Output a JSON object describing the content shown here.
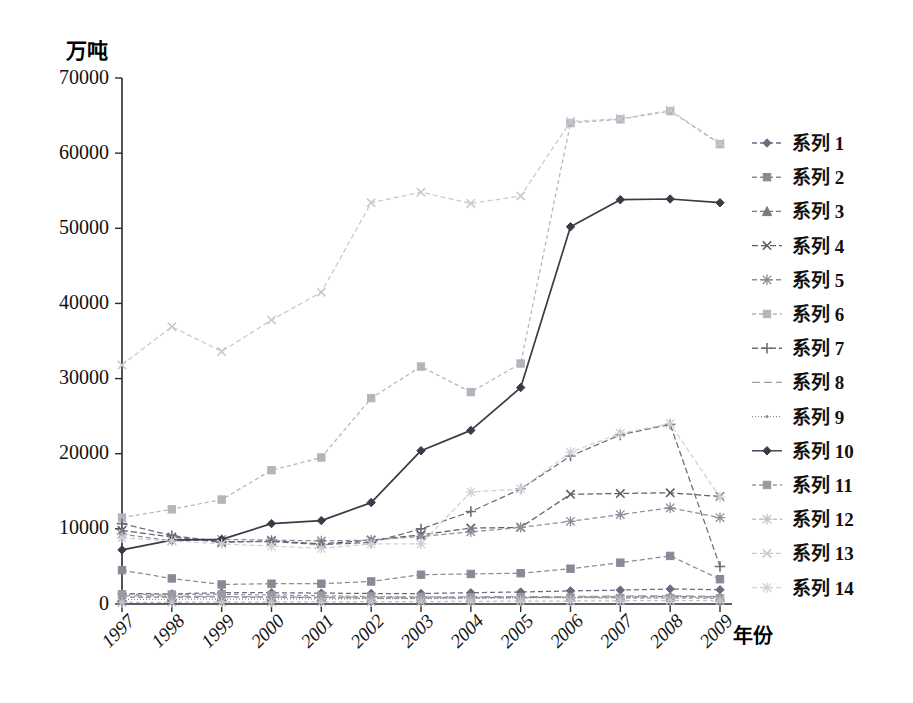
{
  "chart_data": {
    "type": "line",
    "title": "",
    "ylabel": "万吨",
    "xlabel": "年份",
    "ylim": [
      0,
      70000
    ],
    "ytick_values": [
      0,
      10000,
      20000,
      30000,
      40000,
      50000,
      60000,
      70000
    ],
    "ytick_labels": [
      "0",
      "10000",
      "20000",
      "30000",
      "40000",
      "50000",
      "60000",
      "70000"
    ],
    "grid": false,
    "legend_position": "right",
    "categories": [
      "1997",
      "1998",
      "1999",
      "2000",
      "2001",
      "2002",
      "2003",
      "2004",
      "2005",
      "2006",
      "2007",
      "2008",
      "2009"
    ],
    "series": [
      {
        "name": "系列 1",
        "marker": "diamond",
        "color": "#6b6b80",
        "dash": "5,3",
        "values": [
          1400,
          1350,
          1500,
          1500,
          1450,
          1400,
          1400,
          1500,
          1600,
          1750,
          1850,
          2000,
          1900
        ]
      },
      {
        "name": "系列 2",
        "marker": "square",
        "color": "#8a8a96",
        "dash": "5,3",
        "values": [
          4500,
          3400,
          2600,
          2700,
          2700,
          3000,
          3900,
          4000,
          4100,
          4700,
          5500,
          6400,
          3300
        ]
      },
      {
        "name": "系列 3",
        "marker": "triangle",
        "color": "#7a7a86",
        "dash": "5,3",
        "values": [
          900,
          900,
          950,
          900,
          850,
          800,
          800,
          820,
          850,
          900,
          950,
          1000,
          950
        ]
      },
      {
        "name": "系列 4",
        "marker": "cross",
        "color": "#5d5d6b",
        "dash": "6,3",
        "values": [
          9800,
          8900,
          8200,
          8400,
          8000,
          8500,
          9200,
          10100,
          10200,
          14600,
          14700,
          14800,
          14300
        ]
      },
      {
        "name": "系列 5",
        "marker": "star",
        "color": "#8e8e9a",
        "dash": "5,3",
        "values": [
          9300,
          8400,
          8600,
          8500,
          8400,
          8500,
          9000,
          9600,
          10200,
          11000,
          11900,
          12800,
          11500
        ]
      },
      {
        "name": "系列 6",
        "marker": "square",
        "color": "#b4b4bd",
        "dash": "4,3",
        "values": [
          11500,
          12600,
          13900,
          17800,
          19500,
          27400,
          31600,
          28200,
          32000,
          64000,
          64500,
          65600,
          61200
        ]
      },
      {
        "name": "系列 7",
        "marker": "plus",
        "color": "#6d6d7a",
        "dash": "6,3",
        "values": [
          10700,
          9100,
          8300,
          8300,
          7900,
          8200,
          10000,
          12300,
          15300,
          19700,
          22500,
          23900,
          5000
        ]
      },
      {
        "name": "系列 8",
        "marker": "none",
        "color": "#9c9ca6",
        "dash": "8,4",
        "values": [
          1100,
          1050,
          1000,
          950,
          900,
          900,
          900,
          950,
          1000,
          1000,
          1050,
          1100,
          1000
        ]
      },
      {
        "name": "系列 9",
        "marker": "dashdot",
        "color": "#8b8b95",
        "dash": "1,2",
        "values": [
          600,
          620,
          650,
          660,
          680,
          700,
          720,
          760,
          800,
          850,
          900,
          950,
          900
        ]
      },
      {
        "name": "系列 10",
        "marker": "diamond",
        "color": "#3a3a48",
        "dash": "none",
        "values": [
          7200,
          8500,
          8600,
          10700,
          11100,
          13500,
          20400,
          23100,
          28800,
          50200,
          53800,
          53900,
          53400
        ]
      },
      {
        "name": "系列 11",
        "marker": "square",
        "color": "#9a9aa4",
        "dash": "4,3",
        "values": [
          1300,
          1250,
          1300,
          1200,
          1100,
          1000,
          950,
          900,
          900,
          850,
          800,
          800,
          750
        ]
      },
      {
        "name": "系列 12",
        "marker": "star",
        "color": "#c2c2ca",
        "dash": "4,3",
        "values": [
          200,
          220,
          250,
          260,
          280,
          300,
          320,
          350,
          380,
          400,
          430,
          460,
          420
        ]
      },
      {
        "name": "系列 13",
        "marker": "cross",
        "color": "#c8c8d0",
        "dash": "5,3",
        "values": [
          31800,
          36900,
          33600,
          37800,
          41500,
          53400,
          54800,
          53300,
          54300,
          64200,
          64600,
          65700,
          61300
        ]
      },
      {
        "name": "系列 14",
        "marker": "star",
        "color": "#cfcfd6",
        "dash": "5,3",
        "values": [
          8800,
          8400,
          8000,
          7700,
          7400,
          8000,
          8000,
          14900,
          15300,
          20200,
          22700,
          24000,
          14200
        ]
      }
    ]
  },
  "legend": {
    "items": [
      "系列 1",
      "系列 2",
      "系列 3",
      "系列 4",
      "系列 5",
      "系列 6",
      "系列 7",
      "系列 8",
      "系列 9",
      "系列 10",
      "系列 11",
      "系列 12",
      "系列 13",
      "系列 14"
    ]
  }
}
